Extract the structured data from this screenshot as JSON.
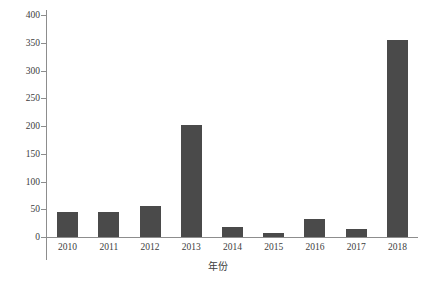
{
  "chart_data": {
    "type": "bar",
    "title": "",
    "xlabel": "年份",
    "ylabel": "穿山甲鳞片 (kg)",
    "categories": [
      "2010",
      "2011",
      "2012",
      "2013",
      "2014",
      "2015",
      "2016",
      "2017",
      "2018"
    ],
    "values": [
      45,
      45,
      55,
      202,
      18,
      7,
      32,
      15,
      355
    ],
    "series": [
      {
        "name": "穿山甲鳞片",
        "values": [
          45,
          45,
          55,
          202,
          18,
          7,
          32,
          15,
          355
        ]
      }
    ],
    "ylim": [
      0,
      400
    ],
    "ytick_labels": [
      "0",
      "50",
      "100",
      "150",
      "200",
      "250",
      "300",
      "350",
      "400"
    ],
    "ytick_values": [
      0,
      50,
      100,
      150,
      200,
      250,
      300,
      350,
      400
    ],
    "grid": false,
    "legend": false,
    "legend_position": "none",
    "bar_color": "#4a4a4a",
    "axis_color": "#8d8d8d",
    "background_color": "#ffffff",
    "text_color": "#3d3d3d"
  }
}
